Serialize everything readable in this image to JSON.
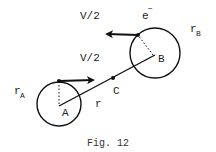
{
  "figure": {
    "caption": "Fig. 12",
    "labels": {
      "velocity_top": "V/2",
      "velocity_mid": "V/2",
      "electron": "e",
      "electron_sup": "−",
      "radius_A": "r",
      "radius_A_sub": "A",
      "radius_B": "r",
      "radius_B_sub": "B",
      "point_A": "A",
      "point_B": "B",
      "point_C": "C",
      "separation": "r"
    },
    "elements": {
      "circle_A": {
        "cx": 59,
        "cy": 104,
        "r": 22
      },
      "circle_B": {
        "cx": 155,
        "cy": 53,
        "r": 25
      },
      "center_point_C": {
        "x": 113,
        "y": 78
      }
    },
    "colors": {
      "ink": "#111111",
      "background": "#ffffff"
    }
  }
}
